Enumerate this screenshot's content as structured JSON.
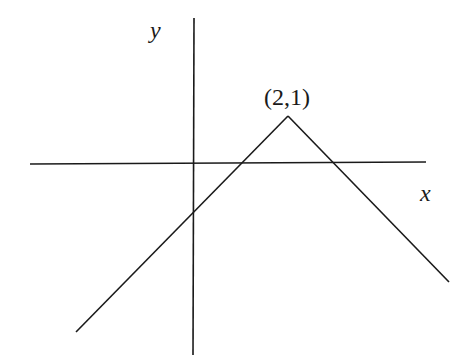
{
  "diagram": {
    "type": "function-graph",
    "axes": {
      "x_label": "x",
      "y_label": "y"
    },
    "vertex": {
      "label": "(2,1)",
      "x": 2,
      "y": 1
    },
    "colors": {
      "stroke": "#1a1a1a",
      "background": "#ffffff"
    }
  }
}
